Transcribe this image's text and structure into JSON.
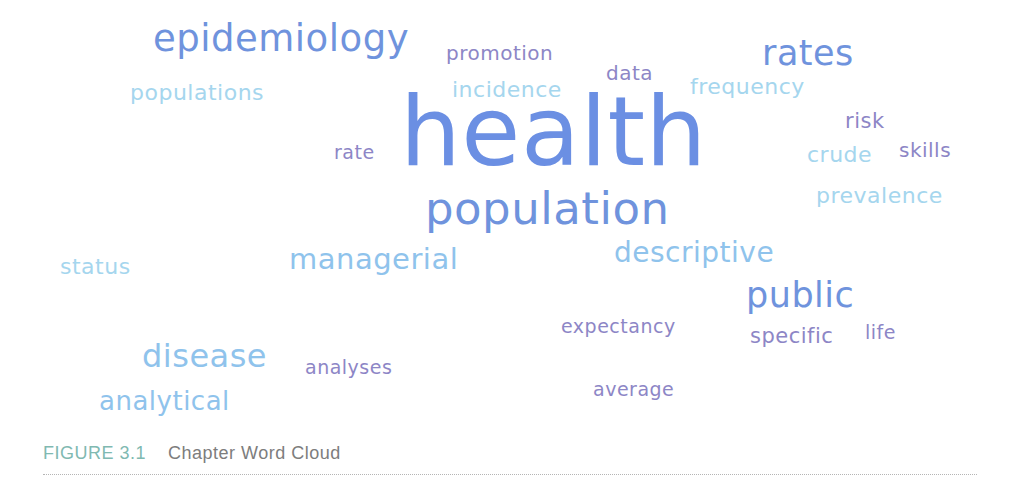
{
  "figure": {
    "label": "FIGURE 3.1",
    "title": "Chapter Word Cloud"
  },
  "colors": {
    "blue": "#6b8fe3",
    "light_blue": "#8fc3ec",
    "pale_blue": "#a5d6ee",
    "purple": "#8d86c6",
    "caption_label": "#80b9b1",
    "caption_title": "#7d7d7d"
  },
  "words": [
    {
      "text": "health",
      "x": 400,
      "y": 84,
      "size": 96,
      "color": "#6b8fe3"
    },
    {
      "text": "epidemiology",
      "x": 153,
      "y": 20,
      "size": 37,
      "color": "#6f93dd"
    },
    {
      "text": "population",
      "x": 425,
      "y": 186,
      "size": 45,
      "color": "#6f93dd"
    },
    {
      "text": "rates",
      "x": 762,
      "y": 36,
      "size": 35,
      "color": "#6f93dd"
    },
    {
      "text": "public",
      "x": 746,
      "y": 278,
      "size": 35,
      "color": "#6f93dd"
    },
    {
      "text": "disease",
      "x": 142,
      "y": 340,
      "size": 32,
      "color": "#8fc3ec"
    },
    {
      "text": "managerial",
      "x": 289,
      "y": 245,
      "size": 29,
      "color": "#8fc3ec"
    },
    {
      "text": "descriptive",
      "x": 614,
      "y": 239,
      "size": 28,
      "color": "#8fc3ec"
    },
    {
      "text": "analytical",
      "x": 99,
      "y": 388,
      "size": 26,
      "color": "#8fc3ec"
    },
    {
      "text": "populations",
      "x": 130,
      "y": 82,
      "size": 22,
      "color": "#a5d6ee"
    },
    {
      "text": "incidence",
      "x": 452,
      "y": 79,
      "size": 22,
      "color": "#a5d6ee"
    },
    {
      "text": "frequency",
      "x": 690,
      "y": 76,
      "size": 22,
      "color": "#a5d6ee"
    },
    {
      "text": "crude",
      "x": 807,
      "y": 144,
      "size": 22,
      "color": "#a5d6ee"
    },
    {
      "text": "prevalence",
      "x": 816,
      "y": 185,
      "size": 22,
      "color": "#a5d6ee"
    },
    {
      "text": "status",
      "x": 60,
      "y": 256,
      "size": 22,
      "color": "#a5d6ee"
    },
    {
      "text": "promotion",
      "x": 446,
      "y": 43,
      "size": 20,
      "color": "#8d86c6"
    },
    {
      "text": "data",
      "x": 606,
      "y": 63,
      "size": 20,
      "color": "#8d86c6"
    },
    {
      "text": "rate",
      "x": 334,
      "y": 143,
      "size": 19,
      "color": "#8d86c6"
    },
    {
      "text": "risk",
      "x": 845,
      "y": 111,
      "size": 21,
      "color": "#8d86c6"
    },
    {
      "text": "skills",
      "x": 899,
      "y": 140,
      "size": 20,
      "color": "#8d86c6"
    },
    {
      "text": "expectancy",
      "x": 561,
      "y": 317,
      "size": 19,
      "color": "#8d86c6"
    },
    {
      "text": "specific",
      "x": 750,
      "y": 326,
      "size": 21,
      "color": "#8d86c6"
    },
    {
      "text": "life",
      "x": 865,
      "y": 323,
      "size": 19,
      "color": "#8d86c6"
    },
    {
      "text": "analyses",
      "x": 305,
      "y": 358,
      "size": 19,
      "color": "#8d86c6"
    },
    {
      "text": "average",
      "x": 593,
      "y": 380,
      "size": 19,
      "color": "#8d86c6"
    }
  ]
}
